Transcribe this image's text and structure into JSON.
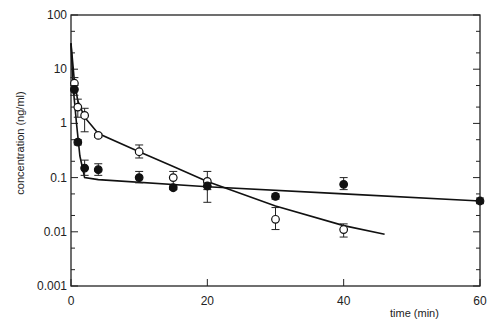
{
  "chart_data": {
    "type": "scatter",
    "title": "",
    "xlabel": "time (min)",
    "ylabel": "concentration (ng/ml)",
    "xlim": [
      0,
      60
    ],
    "ylim": [
      0.001,
      100
    ],
    "yscale": "log",
    "grid": false,
    "legend": null,
    "x_ticks": [
      "0",
      "20",
      "40",
      "60"
    ],
    "y_ticks": [
      "0.001",
      "0.01",
      "0.1",
      "1",
      "10",
      "100"
    ],
    "series": [
      {
        "name": "open circles",
        "marker": "open-circle",
        "points": [
          {
            "x": 0.5,
            "y": 5.5,
            "err": [
              4.5,
              7
            ]
          },
          {
            "x": 1,
            "y": 2.0,
            "err": [
              1.3,
              2.8
            ]
          },
          {
            "x": 2,
            "y": 1.4,
            "err": [
              0.7,
              1.9
            ]
          },
          {
            "x": 4,
            "y": 0.6,
            "err": [
              0.55,
              0.65
            ]
          },
          {
            "x": 10,
            "y": 0.3,
            "err": [
              0.23,
              0.4
            ]
          },
          {
            "x": 15,
            "y": 0.1,
            "err": [
              0.07,
              0.13
            ]
          },
          {
            "x": 20,
            "y": 0.085,
            "err": [
              0.035,
              0.13
            ]
          },
          {
            "x": 30,
            "y": 0.017,
            "err": [
              0.011,
              0.028
            ]
          },
          {
            "x": 40,
            "y": 0.011,
            "err": [
              0.008,
              0.014
            ]
          }
        ],
        "fit_line": [
          {
            "x": 0,
            "y": 30
          },
          {
            "x": 0.5,
            "y": 6
          },
          {
            "x": 1,
            "y": 2.6
          },
          {
            "x": 2,
            "y": 1.3
          },
          {
            "x": 4,
            "y": 0.65
          },
          {
            "x": 10,
            "y": 0.3
          },
          {
            "x": 15,
            "y": 0.16
          },
          {
            "x": 20,
            "y": 0.085
          },
          {
            "x": 30,
            "y": 0.03
          },
          {
            "x": 40,
            "y": 0.013
          },
          {
            "x": 46,
            "y": 0.009
          }
        ]
      },
      {
        "name": "filled circles",
        "marker": "filled-circle",
        "points": [
          {
            "x": 0.5,
            "y": 4.2,
            "err": [
              3.3,
              5
            ]
          },
          {
            "x": 1,
            "y": 0.45,
            "err": [
              0.4,
              0.5
            ]
          },
          {
            "x": 2,
            "y": 0.15,
            "err": [
              0.11,
              0.21
            ]
          },
          {
            "x": 4,
            "y": 0.14,
            "err": [
              0.11,
              0.18
            ]
          },
          {
            "x": 10,
            "y": 0.1,
            "err": [
              0.08,
              0.13
            ]
          },
          {
            "x": 15,
            "y": 0.065,
            "err": [
              0.06,
              0.07
            ]
          },
          {
            "x": 20,
            "y": 0.07,
            "err": [
              0.06,
              0.08
            ]
          },
          {
            "x": 30,
            "y": 0.045,
            "err": [
              0.04,
              0.05
            ]
          },
          {
            "x": 40,
            "y": 0.075,
            "err": [
              0.06,
              0.1
            ]
          },
          {
            "x": 60,
            "y": 0.037,
            "err": [
              0.033,
              0.042
            ]
          }
        ],
        "fit_line": [
          {
            "x": 0,
            "y": 30
          },
          {
            "x": 0.3,
            "y": 5
          },
          {
            "x": 0.8,
            "y": 1
          },
          {
            "x": 1.3,
            "y": 0.25
          },
          {
            "x": 2,
            "y": 0.1
          },
          {
            "x": 4,
            "y": 0.092
          },
          {
            "x": 20,
            "y": 0.068
          },
          {
            "x": 40,
            "y": 0.05
          },
          {
            "x": 60,
            "y": 0.037
          }
        ]
      }
    ]
  }
}
